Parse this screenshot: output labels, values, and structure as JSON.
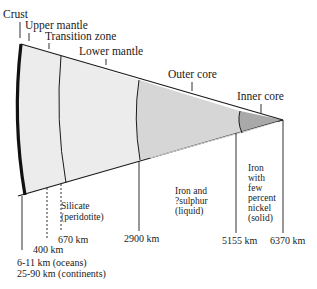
{
  "diagram": {
    "title_labels": {
      "crust": "Crust",
      "upper_mantle": "Upper mantle",
      "transition_zone": "Transition zone",
      "lower_mantle": "Lower mantle",
      "outer_core": "Outer core",
      "inner_core": "Inner core"
    },
    "depth_labels": {
      "crust_oceans": "6-11 km  (oceans)",
      "crust_continents": "25-90 km (continents)",
      "d400": "400 km",
      "d670": "670 km",
      "d2900": "2900 km",
      "d5155": "5155 km",
      "d6370": "6370 km"
    },
    "composition": {
      "mantle": [
        "Silicate",
        "(peridotite)"
      ],
      "outer_core": [
        "Iron  and",
        "?sulphur",
        "(liquid)"
      ],
      "inner_core": [
        "Iron",
        "with",
        "few",
        "percent",
        "nickel",
        "(solid)"
      ]
    },
    "colors": {
      "mantle_fill": "#ececec",
      "outer_core_fill": "#d6d6d6",
      "inner_core_fill": "#a9a9a9",
      "line": "#1a1a1a"
    }
  }
}
